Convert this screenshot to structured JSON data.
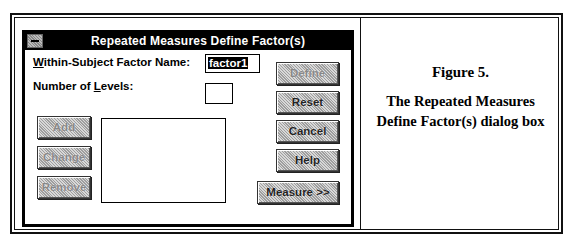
{
  "figure": {
    "label": "Figure 5.",
    "caption_line1": "The Repeated Measures",
    "caption_line2": "Define Factor(s) dialog box"
  },
  "dialog": {
    "title": "Repeated Measures Define Factor(s)",
    "system_menu_icon": "system-menu-icon",
    "factor_name_label_prefix": "W",
    "factor_name_label_rest": "ithin-Subject Factor Name:",
    "factor_name_value": "factor1",
    "levels_label_pre": "Number of ",
    "levels_label_u": "L",
    "levels_label_post": "evels:",
    "levels_value": "",
    "list_items": [],
    "buttons": {
      "add": "Add",
      "change": "Change",
      "remove": "Remove",
      "define": "Define",
      "reset": "Reset",
      "cancel": "Cancel",
      "help": "Help",
      "measure": "Measure >>"
    }
  }
}
